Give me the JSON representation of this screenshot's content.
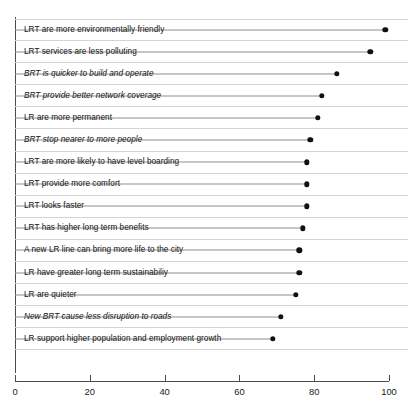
{
  "chart": {
    "title": "",
    "title_note": "clipped-title-row"
  },
  "axis": {
    "x_ticks": [
      "0",
      "20",
      "40",
      "60",
      "80",
      "100"
    ]
  },
  "chart_data": {
    "type": "bar",
    "subtype": "lollipop-horizontal",
    "title": "",
    "xlabel": "",
    "ylabel": "",
    "xlim": [
      0,
      100
    ],
    "grid": false,
    "legend": "none",
    "categories": [
      "LRT are more environmentally friendly",
      "LRT services are less polluting",
      "BRT is quicker to build and operate",
      "BRT provide better network coverage",
      "LR are more permanent",
      "BRT stop nearer to more people",
      "LRT are more likely to have level boarding",
      "LRT provide more comfort",
      "LRT looks faster",
      "LRT has higher long term benefits",
      "A new LR line can bring more life to the city",
      "LR have greater long term sustainabiliy",
      "LR are quieter",
      "New BRT cause less disruption to roads",
      "LR support higher population and employment growth"
    ],
    "values": [
      99,
      95,
      86,
      82,
      81,
      79,
      78,
      78,
      78,
      77,
      76,
      76,
      75,
      71,
      69
    ],
    "xticks": [
      0,
      20,
      40,
      60,
      80,
      100
    ]
  },
  "rows": [
    {
      "label": "LRT are more environmentally friendly",
      "value": 99,
      "italic": false
    },
    {
      "label": "LRT services are less polluting",
      "value": 95,
      "italic": false
    },
    {
      "label": "BRT is quicker to build and operate",
      "value": 86,
      "italic": true
    },
    {
      "label": "BRT provide better network coverage",
      "value": 82,
      "italic": true
    },
    {
      "label": "LR are more permanent",
      "value": 81,
      "italic": false
    },
    {
      "label": "BRT stop nearer to more people",
      "value": 79,
      "italic": true
    },
    {
      "label": "LRT are more likely to have level boarding",
      "value": 78,
      "italic": false
    },
    {
      "label": "LRT provide more comfort",
      "value": 78,
      "italic": false
    },
    {
      "label": "LRT looks faster",
      "value": 78,
      "italic": false
    },
    {
      "label": "LRT has higher long term benefits",
      "value": 77,
      "italic": false
    },
    {
      "label": "A new LR line can bring more life to the city",
      "value": 76,
      "italic": false
    },
    {
      "label": "LR have greater long term sustainabiliy",
      "value": 76,
      "italic": false
    },
    {
      "label": "LR are quieter",
      "value": 75,
      "italic": false
    },
    {
      "label": "New BRT cause less disruption to roads",
      "value": 71,
      "italic": true
    },
    {
      "label": "LR support higher population and employment growth",
      "value": 69,
      "italic": false
    }
  ],
  "colors": {
    "dot": "#111111",
    "stem": "#8e8e8e",
    "axis": "#4c4c4c",
    "rule": "#d4d4d4",
    "text": "#141414",
    "background": "#ffffff"
  }
}
